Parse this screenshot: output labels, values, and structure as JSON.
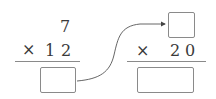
{
  "left_problem": {
    "multiplicand": "7",
    "operator": "×",
    "multiplier_digits": [
      "1",
      "2"
    ],
    "answer": ""
  },
  "right_problem": {
    "multiplicand": "",
    "operator": "×",
    "multiplier_digits": [
      "2",
      "0"
    ],
    "answer": ""
  },
  "colors": {
    "line": "#8a8a8a",
    "text": "#3a3a3a",
    "arrow": "#444444"
  }
}
